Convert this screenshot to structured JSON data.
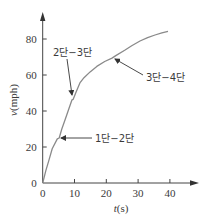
{
  "chart_data": {
    "type": "line",
    "title": "",
    "xlabel_var": "t",
    "xlabel_unit": "(s)",
    "ylabel_var": "v",
    "ylabel_unit": "(mph)",
    "xlim": [
      0,
      40
    ],
    "ylim": [
      0,
      80
    ],
    "x_ticks": [
      0,
      10,
      20,
      30,
      40
    ],
    "y_ticks": [
      0,
      20,
      40,
      60,
      80
    ],
    "x_tick_labels": [
      "0",
      "10",
      "20",
      "30",
      "40"
    ],
    "y_tick_labels": [
      "0",
      "20",
      "40",
      "60",
      "80"
    ],
    "grid": false,
    "legend": null,
    "series": [
      {
        "name": "v(t)",
        "x": [
          0,
          1,
          2,
          3,
          4.6,
          5.2,
          6,
          7,
          8,
          9.2,
          9.6,
          10.5,
          11.7,
          13,
          14.9,
          17,
          19.5,
          21.8,
          23,
          25.9,
          28,
          30.6,
          33,
          35.3,
          37.5,
          39.4
        ],
        "y": [
          0,
          7,
          13,
          19,
          24.5,
          25,
          30,
          35,
          40,
          46.2,
          46.5,
          50.5,
          55.6,
          58.5,
          61.7,
          64.8,
          67.5,
          69.4,
          70.8,
          73.9,
          76.3,
          78.9,
          80.7,
          82.2,
          83.4,
          84.2
        ]
      }
    ],
    "annotations": [
      {
        "text": "1단−2단",
        "point": [
          4.6,
          24.5
        ]
      },
      {
        "text": "2단−3단",
        "point": [
          9.2,
          46.2
        ]
      },
      {
        "text": "3단−4단",
        "point": [
          21.8,
          69.4
        ]
      }
    ]
  }
}
